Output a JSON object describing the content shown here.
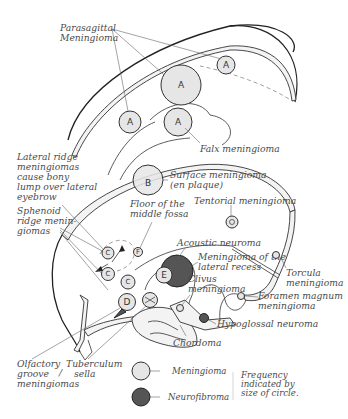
{
  "figure": {
    "type": "anatomical-diagram"
  },
  "labels": {
    "parasagittal": [
      "Parasagittal",
      "Meningioma"
    ],
    "falx": "Falx meningioma",
    "lateral_ridge": [
      "Lateral ridge",
      "meningiomas",
      "cause bony",
      "lump over lateral",
      "eyebrow"
    ],
    "sphenoid_ridge": [
      "Sphenoid",
      "ridge menin-",
      "giomas"
    ],
    "surface": [
      "Surface meningioma",
      "(en plaque)"
    ],
    "floor_middle_fossa": [
      "Floor of the",
      "middle fossa"
    ],
    "tentorial": "Tentorial meningioma",
    "acoustic": "Acoustic neuroma",
    "lateral_recess": [
      "Meningioma of the",
      "lateral recess"
    ],
    "clivus": [
      "Clivus",
      "meningioma"
    ],
    "torcula": [
      "Torcula",
      "meningioma"
    ],
    "foramen_magnum": [
      "Foramen magnum",
      "meningioma"
    ],
    "hypoglossal": "Hypoglossal neuroma",
    "chordoma": "Chordoma",
    "olfactory": [
      "Olfactory",
      "groove",
      "meningiomas"
    ],
    "tuberculum": [
      "Tuberculum",
      "sella"
    ],
    "slash": "/"
  },
  "circles": {
    "A": "A",
    "B": "B",
    "C": "C",
    "D": "D",
    "E": "E",
    "F": "F",
    "G": "G"
  },
  "legend": {
    "items": [
      {
        "label": "Meningioma",
        "swatch": "light-circle",
        "color": "#e6e6e6"
      },
      {
        "label": "Neurofibroma",
        "swatch": "dark-circle",
        "color": "#555555"
      }
    ],
    "note": [
      "Frequency",
      "indicated by",
      "size of circle."
    ]
  },
  "colors": {
    "meningioma_fill": "#e6e6e6",
    "neurofibroma_fill": "#555555",
    "line": "#222222",
    "text": "#4a4a4a"
  }
}
